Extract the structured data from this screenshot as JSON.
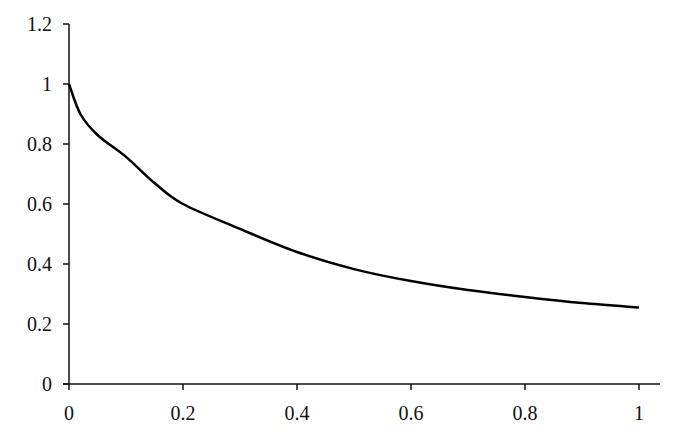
{
  "chart_data": {
    "type": "line",
    "title": "",
    "xlabel": "",
    "ylabel": "",
    "xlim": [
      0,
      1
    ],
    "ylim": [
      0,
      1.2
    ],
    "grid": false,
    "legend": null,
    "x_ticks": [
      "0",
      "0.2",
      "0.4",
      "0.6",
      "0.8",
      "1"
    ],
    "y_ticks": [
      "0",
      "0.2",
      "0.4",
      "0.6",
      "0.8",
      "1",
      "1.2"
    ],
    "series": [
      {
        "name": "curve",
        "color": "#000000",
        "x": [
          0,
          0.02,
          0.05,
          0.1,
          0.15,
          0.2,
          0.3,
          0.4,
          0.5,
          0.6,
          0.7,
          0.8,
          0.9,
          1.0
        ],
        "values": [
          1.0,
          0.9,
          0.83,
          0.757,
          0.67,
          0.6,
          0.517,
          0.44,
          0.383,
          0.343,
          0.313,
          0.29,
          0.27,
          0.255
        ]
      }
    ]
  }
}
